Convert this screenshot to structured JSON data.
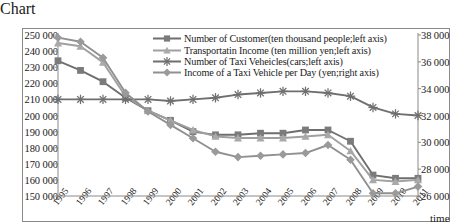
{
  "chart_data": {
    "type": "line",
    "title": "",
    "subtitle": "",
    "xlabel": "time",
    "ylabel": "",
    "grid": false,
    "legend_position": "top-right",
    "x": [
      "1995",
      "1996",
      "1997",
      "1998",
      "1999",
      "2000",
      "2001",
      "2002",
      "2003",
      "2004",
      "2005",
      "2006",
      "2007",
      "2008",
      "2009",
      "2010",
      "2011"
    ],
    "categories": [
      "1995",
      "1996",
      "1997",
      "1998",
      "1999",
      "2000",
      "2001",
      "2002",
      "2003",
      "2004",
      "2005",
      "2006",
      "2007",
      "2008",
      "2009",
      "2010",
      "2011"
    ],
    "left_axis": {
      "ylim": [
        150000,
        250000
      ],
      "ticks": [
        "150 000",
        "160 000",
        "170 000",
        "180 000",
        "190 000",
        "200 000",
        "210 000",
        "220 000",
        "230 000",
        "240 000",
        "250 000"
      ],
      "tick_values": [
        150000,
        160000,
        170000,
        180000,
        190000,
        200000,
        210000,
        220000,
        230000,
        240000,
        250000
      ]
    },
    "right_axis": {
      "ylim": [
        26000,
        38000
      ],
      "ticks": [
        "26 000",
        "28 000",
        "30 000",
        "32 000",
        "34 000",
        "36 000",
        "38 000"
      ],
      "tick_values": [
        26000,
        28000,
        30000,
        32000,
        34000,
        36000,
        38000
      ]
    },
    "series": [
      {
        "name": "Number of Customer(ten thousand people;left axis)",
        "axis": "left",
        "marker": "square",
        "color": "#7b7b7b",
        "line_color": "#6e6e6e",
        "values": [
          234000,
          228000,
          221000,
          211000,
          203000,
          197000,
          190000,
          188000,
          188000,
          189000,
          189000,
          191000,
          191000,
          184000,
          163000,
          161000,
          161000
        ]
      },
      {
        "name": "Transportatin Income  (ten million yen;left axis)",
        "axis": "left",
        "marker": "triangle",
        "color": "#a9a9a9",
        "line_color": "#a0a0a0",
        "values": [
          245000,
          243000,
          233000,
          212000,
          203000,
          197000,
          191000,
          187000,
          186000,
          186000,
          186000,
          187000,
          188000,
          178000,
          160000,
          159000,
          160000
        ]
      },
      {
        "name": "Number of Taxi Veheicles(cars;left axis)",
        "axis": "left",
        "marker": "asterisk",
        "color": "#6f6f6f",
        "line_color": "#6f6f6f",
        "values": [
          210000,
          210000,
          210000,
          210000,
          210000,
          209000,
          210000,
          211000,
          213000,
          214000,
          215000,
          215000,
          214000,
          212000,
          205000,
          201000,
          200000
        ]
      },
      {
        "name": "Income of a Taxi Vehicle per Day  (yen;right axis)",
        "axis": "right",
        "marker": "diamond",
        "color": "#9a9a9a",
        "line_color": "#909090",
        "values": [
          37800,
          37500,
          36300,
          33700,
          32300,
          31300,
          30300,
          29300,
          28900,
          29000,
          29100,
          29200,
          29800,
          28700,
          26200,
          26200,
          26700
        ]
      }
    ]
  },
  "legend": {
    "items": [
      {
        "label": "Number of Customer(ten thousand people;left axis)",
        "marker": "square"
      },
      {
        "label": "Transportatin Income  (ten million yen;left axis)",
        "marker": "triangle"
      },
      {
        "label": "Number of Taxi Veheicles(cars;left axis)",
        "marker": "asterisk"
      },
      {
        "label": "Income of a Taxi Vehicle per Day  (yen;right axis)",
        "marker": "diamond"
      }
    ]
  }
}
